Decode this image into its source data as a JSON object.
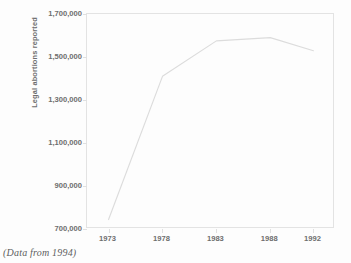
{
  "caption": "(Data from 1994)",
  "colors": {
    "background": "#fdfdfd",
    "line": "#dcdcdc",
    "frame": "#e3e3e3",
    "text": "#6e6e6e",
    "caption_text": "#5d5d5d"
  },
  "chart_data": {
    "type": "line",
    "title": "",
    "subtitle": "",
    "xlabel": "",
    "ylabel": "Legal abortions reported",
    "x": [
      1973,
      1978,
      1983,
      1988,
      1992
    ],
    "categories": [
      "1973",
      "1978",
      "1983",
      "1988",
      "1992"
    ],
    "values": [
      744000,
      1410000,
      1575000,
      1590000,
      1529000
    ],
    "series": [
      {
        "name": "Legal abortions reported",
        "values": [
          744000,
          1410000,
          1575000,
          1590000,
          1529000
        ]
      }
    ],
    "xlim": [
      1971,
      1994
    ],
    "ylim": [
      700000,
      1700000
    ],
    "xticks": [
      1973,
      1978,
      1983,
      1988,
      1992
    ],
    "xticklabels": [
      "1973",
      "1978",
      "1983",
      "1988",
      "1992"
    ],
    "yticks": [
      700000,
      900000,
      1100000,
      1300000,
      1500000,
      1700000
    ],
    "yticklabels": [
      "700,000",
      "900,000",
      "1,100,000",
      "1,300,000",
      "1,500,000",
      "1,700,000"
    ],
    "grid": false,
    "legend": false,
    "legend_position": "none",
    "annotations": [
      "(Data from 1994)"
    ]
  }
}
